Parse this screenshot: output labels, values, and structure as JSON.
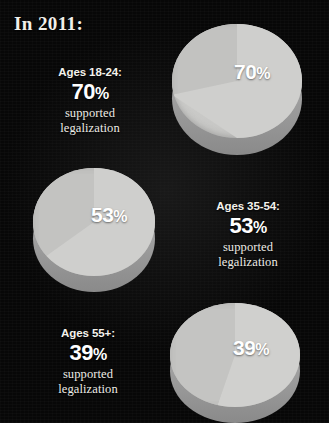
{
  "title": "In 2011:",
  "theme": {
    "background": "#070707",
    "pie_top": "#cbcbc9",
    "pie_side": "#9a9a9a",
    "text": "#f2f0ea",
    "pie_label_text": "#ffffff"
  },
  "groups": [
    {
      "id": "ages-18-24",
      "age_label": "Ages 18-24:",
      "percent": "70",
      "percent_symbol": "%",
      "supported": "supported",
      "legalization": "legalization",
      "pie_label": "70",
      "pie_label_symbol": "%"
    },
    {
      "id": "ages-35-54",
      "age_label": "Ages 35-54:",
      "percent": "53",
      "percent_symbol": "%",
      "supported": "supported",
      "legalization": "legalization",
      "pie_label": "53",
      "pie_label_symbol": "%"
    },
    {
      "id": "ages-55-plus",
      "age_label": "Ages 55+:",
      "percent": "39",
      "percent_symbol": "%",
      "supported": "supported",
      "legalization": "legalization",
      "pie_label": "39",
      "pie_label_symbol": "%"
    }
  ],
  "chart_data": {
    "type": "pie",
    "title": "In 2011:",
    "xlabel": "",
    "ylabel": "",
    "legend_position": "beside-each-chart",
    "grid": false,
    "note": "Three separate 3D pie charts; each shows the share of an age group that supported legalization.",
    "charts": [
      {
        "name": "Ages 18-24",
        "categories": [
          "supported legalization",
          "did not support"
        ],
        "values": [
          70,
          30
        ],
        "labels": [
          "70%",
          ""
        ],
        "title": "Ages 18-24: 70% supported legalization"
      },
      {
        "name": "Ages 35-54",
        "categories": [
          "supported legalization",
          "did not support"
        ],
        "values": [
          53,
          47
        ],
        "labels": [
          "53%",
          ""
        ],
        "title": "Ages 35-54: 53% supported legalization"
      },
      {
        "name": "Ages 55+",
        "categories": [
          "supported legalization",
          "did not support"
        ],
        "values": [
          39,
          61
        ],
        "labels": [
          "39%",
          ""
        ],
        "title": "Ages 55+: 39% supported legalization"
      }
    ]
  }
}
